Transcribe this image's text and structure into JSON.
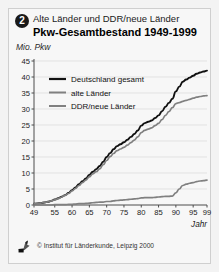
{
  "header": {
    "badge_number": "2",
    "subtitle": "Alte Länder und DDR/neue Länder",
    "title": "Pkw-Gesamtbestand 1949-1999"
  },
  "footer": {
    "credit": "© Institut für Länderkunde, Leipzig 2000",
    "logo_name": "institut-fuer-laenderkunde-logo"
  },
  "colors": {
    "series_total": "#111111",
    "series_west": "#808080",
    "series_east": "#808080",
    "grid": "#d8d8d8",
    "axis": "#4d4d4d",
    "card_bg": "#f7f7f7"
  },
  "chart_data": {
    "type": "line",
    "title": "Pkw-Gesamtbestand 1949-1999",
    "subtitle": "Alte Länder und DDR/neue Länder",
    "xlabel": "Jahr",
    "ylabel": "Mio. Pkw",
    "xlim": [
      49,
      99
    ],
    "ylim": [
      0,
      45
    ],
    "ytick_step": 5,
    "yticks": [
      0,
      5,
      10,
      15,
      20,
      25,
      30,
      35,
      40,
      45
    ],
    "xticks": [
      49,
      55,
      60,
      65,
      70,
      75,
      80,
      85,
      90,
      95,
      99
    ],
    "grid": "horizontal",
    "legend_position": "upper-left-inside",
    "x": [
      49,
      50,
      51,
      52,
      53,
      54,
      55,
      56,
      57,
      58,
      59,
      60,
      61,
      62,
      63,
      64,
      65,
      66,
      67,
      68,
      69,
      70,
      71,
      72,
      73,
      74,
      75,
      76,
      77,
      78,
      79,
      80,
      81,
      82,
      83,
      84,
      85,
      86,
      87,
      88,
      89,
      90,
      91,
      92,
      93,
      94,
      95,
      96,
      97,
      98,
      99
    ],
    "series": [
      {
        "name": "Deutschland gesamt",
        "color": "#111111",
        "values": [
          0.4,
          0.5,
          0.6,
          0.8,
          1.0,
          1.3,
          1.7,
          2.1,
          2.6,
          3.1,
          3.8,
          4.6,
          5.5,
          6.5,
          7.4,
          8.3,
          9.4,
          10.4,
          11.2,
          12.2,
          13.5,
          15.0,
          16.2,
          17.4,
          18.4,
          19.0,
          19.6,
          20.4,
          21.3,
          22.2,
          23.3,
          24.8,
          25.6,
          26.0,
          26.4,
          27.2,
          28.0,
          29.3,
          30.7,
          31.9,
          33.2,
          35.5,
          37.0,
          38.5,
          39.2,
          39.8,
          40.4,
          41.0,
          41.4,
          41.7,
          42.0
        ]
      },
      {
        "name": "alte Länder",
        "color": "#808080",
        "values": [
          0.4,
          0.5,
          0.6,
          0.8,
          1.0,
          1.3,
          1.6,
          2.0,
          2.5,
          3.0,
          3.6,
          4.4,
          5.2,
          6.1,
          7.0,
          7.8,
          8.8,
          9.7,
          10.4,
          11.3,
          12.6,
          13.9,
          15.1,
          16.1,
          17.0,
          17.5,
          18.0,
          18.7,
          19.5,
          20.3,
          21.3,
          22.6,
          23.3,
          23.7,
          24.1,
          24.8,
          25.5,
          26.7,
          28.0,
          29.2,
          30.4,
          31.7,
          32.0,
          32.4,
          32.7,
          33.0,
          33.4,
          33.7,
          33.9,
          34.1,
          34.2
        ]
      },
      {
        "name": "DDR/neue Länder",
        "color": "#808080",
        "values": [
          0.0,
          0.0,
          0.0,
          0.0,
          0.0,
          0.0,
          0.1,
          0.1,
          0.1,
          0.1,
          0.2,
          0.2,
          0.3,
          0.4,
          0.4,
          0.5,
          0.6,
          0.7,
          0.8,
          0.9,
          0.9,
          1.1,
          1.1,
          1.3,
          1.4,
          1.5,
          1.6,
          1.7,
          1.8,
          1.9,
          2.0,
          2.2,
          2.3,
          2.3,
          2.3,
          2.4,
          2.5,
          2.6,
          2.7,
          2.7,
          2.8,
          3.8,
          5.0,
          6.1,
          6.5,
          6.8,
          7.0,
          7.3,
          7.5,
          7.6,
          7.8
        ]
      }
    ]
  }
}
